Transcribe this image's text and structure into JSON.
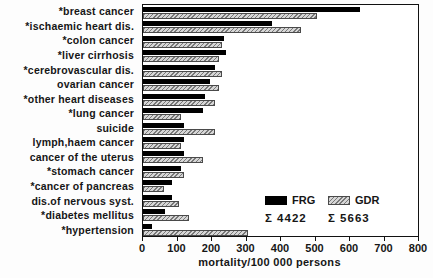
{
  "chart_data": {
    "type": "bar",
    "orientation": "horizontal",
    "title": "",
    "xlabel": "mortality/100 000 persons",
    "xlim": [
      0,
      800
    ],
    "xticks": [
      0,
      100,
      200,
      300,
      400,
      500,
      600,
      700,
      800
    ],
    "grid": false,
    "categories": [
      "*breast cancer",
      "*ischaemic heart dis.",
      "*colon cancer",
      "*liver cirrhosis",
      "*cerebrovascular dis.",
      "ovarian cancer",
      "*other heart diseases",
      "*lung cancer",
      "suicide",
      "lymph,haem cancer",
      "cancer of the uterus",
      "*stomach cancer",
      "*cancer of pancreas",
      "dis.of nervous syst.",
      "*diabetes mellitus",
      "*hypertension"
    ],
    "series": [
      {
        "name": "FRG",
        "style": "solid",
        "color": "#000000",
        "values": [
          630,
          375,
          235,
          240,
          210,
          195,
          180,
          175,
          120,
          120,
          120,
          110,
          85,
          85,
          65,
          25
        ]
      },
      {
        "name": "GDR",
        "style": "hatched",
        "color": "#d6d6d6",
        "hatch_color": "#787878",
        "values": [
          505,
          460,
          230,
          220,
          230,
          220,
          210,
          110,
          210,
          110,
          175,
          120,
          60,
          105,
          135,
          305
        ]
      }
    ],
    "legend": {
      "position": "inside-bottom-right",
      "entries": [
        {
          "label": "FRG",
          "sum_label": "Σ 4422"
        },
        {
          "label": "GDR",
          "sum_label": "Σ 5663"
        }
      ]
    }
  }
}
